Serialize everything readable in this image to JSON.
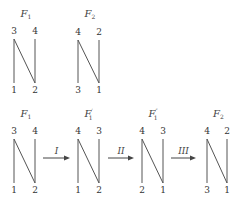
{
  "diagrams": [
    {
      "id": "top-F1",
      "title": "F",
      "subscript": "1",
      "prime": "",
      "x_left": 14,
      "x_right": 35,
      "y_top": 39,
      "y_bottom": 83,
      "title_y": 17,
      "top_labels": [
        "3",
        "4"
      ],
      "bottom_labels": [
        "1",
        "2"
      ]
    },
    {
      "id": "top-F2",
      "title": "F",
      "subscript": "2",
      "prime": "",
      "x_left": 78,
      "x_right": 99,
      "y_top": 40,
      "y_bottom": 83,
      "title_y": 17,
      "top_labels": [
        "4",
        "2"
      ],
      "bottom_labels": [
        "3",
        "1"
      ]
    },
    {
      "id": "bottom-F1",
      "title": "F",
      "subscript": "1",
      "prime": "",
      "x_left": 14,
      "x_right": 35,
      "y_top": 139,
      "y_bottom": 183,
      "title_y": 117,
      "top_labels": [
        "3",
        "4"
      ],
      "bottom_labels": [
        "1",
        "2"
      ]
    },
    {
      "id": "bottom-F1-prime",
      "title": "F",
      "subscript": "1",
      "prime": "′",
      "x_left": 78,
      "x_right": 99,
      "y_top": 139,
      "y_bottom": 183,
      "title_y": 117,
      "top_labels": [
        "4",
        "3"
      ],
      "bottom_labels": [
        "1",
        "2"
      ]
    },
    {
      "id": "bottom-F1-double-prime",
      "title": "F",
      "subscript": "1",
      "prime": "″",
      "x_left": 142,
      "x_right": 163,
      "y_top": 139,
      "y_bottom": 183,
      "title_y": 117,
      "top_labels": [
        "4",
        "3"
      ],
      "bottom_labels": [
        "2",
        "1"
      ]
    },
    {
      "id": "bottom-F2",
      "title": "F",
      "subscript": "2",
      "prime": "",
      "x_left": 207,
      "x_right": 227,
      "y_top": 139,
      "y_bottom": 183,
      "title_y": 117,
      "top_labels": [
        "4",
        "2"
      ],
      "bottom_labels": [
        "3",
        "1"
      ]
    }
  ],
  "arrows": [
    {
      "label": "I",
      "x1": 43,
      "x2": 70,
      "y": 158
    },
    {
      "label": "II",
      "x1": 108,
      "x2": 134,
      "y": 158
    },
    {
      "label": "III",
      "x1": 171,
      "x2": 196,
      "y": 158
    }
  ],
  "colors": {
    "line": "#555555",
    "text": "#333333",
    "background": "#ffffff"
  }
}
